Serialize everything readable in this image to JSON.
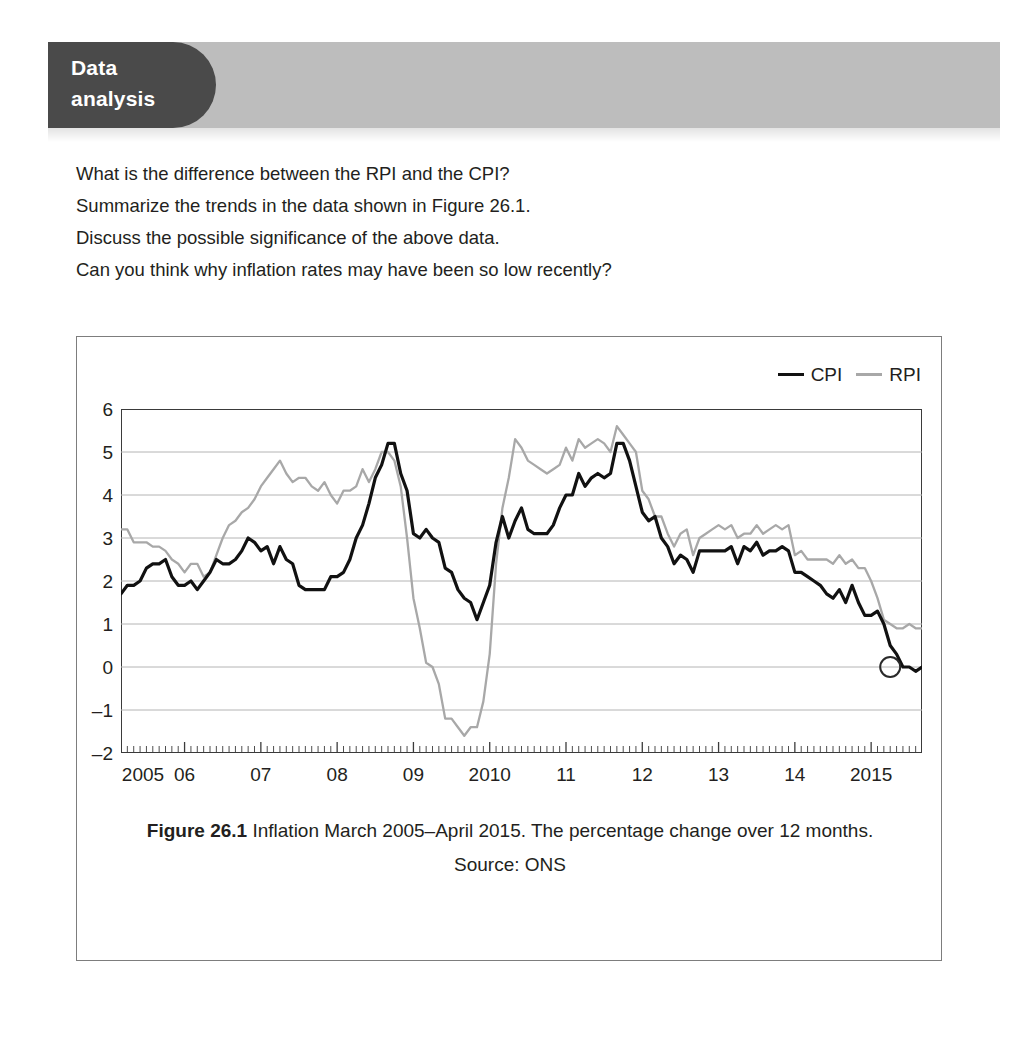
{
  "header": {
    "tab_line1": "Data",
    "tab_line2": "analysis",
    "band_color": "#bdbdbd",
    "tab_color": "#4a4a4a"
  },
  "questions": [
    "What is the difference between the RPI and the CPI?",
    "Summarize the trends in the data shown in Figure 26.1.",
    "Discuss the possible significance of the above data.",
    "Can you think why inflation rates may have been so low recently?"
  ],
  "legend": {
    "items": [
      {
        "label": "CPI",
        "color": "#111111"
      },
      {
        "label": "RPI",
        "color": "#a8a8a8"
      }
    ]
  },
  "caption": {
    "figure_label": "Figure 26.1",
    "text": " Inflation March 2005–April 2015. The percentage change over 12 months.",
    "source": "Source: ONS"
  },
  "axes": {
    "y_ticks": [
      "6",
      "5",
      "4",
      "3",
      "2",
      "1",
      "0",
      "–1",
      "–2"
    ],
    "x_ticks": [
      "2005",
      "06",
      "07",
      "08",
      "09",
      "2010",
      "11",
      "12",
      "13",
      "14",
      "2015"
    ]
  },
  "chart_data": {
    "type": "line",
    "title": "Inflation March 2005–April 2015. The percentage change over 12 months.",
    "source": "Source: ONS",
    "xlabel": "",
    "ylabel": "Percentage change over 12 months (%)",
    "ylim": [
      -2,
      6
    ],
    "ytick_values": [
      6,
      5,
      4,
      3,
      2,
      1,
      0,
      -1,
      -2
    ],
    "xlim": [
      "2005-03",
      "2015-04"
    ],
    "xtick_labels": [
      "2005",
      "06",
      "07",
      "08",
      "09",
      "2010",
      "11",
      "12",
      "13",
      "14",
      "2015"
    ],
    "xtick_positions": [
      "2005-01",
      "2006-01",
      "2007-01",
      "2008-01",
      "2009-01",
      "2010-01",
      "2011-01",
      "2012-01",
      "2013-01",
      "2014-01",
      "2015-01"
    ],
    "minor_ticks": "monthly",
    "grid": "horizontal",
    "legend_position": "top-right",
    "annotation": {
      "marker": "circle",
      "at_x": "2015-04",
      "at_y": 0.0,
      "note": "circled end point of CPI series at 0.0%"
    },
    "x_start": "2005-03",
    "x_step": "1 month",
    "series": [
      {
        "name": "CPI",
        "color": "#111111",
        "values": [
          1.7,
          1.9,
          1.9,
          2.0,
          2.3,
          2.4,
          2.4,
          2.5,
          2.1,
          1.9,
          1.9,
          2.0,
          1.8,
          2.0,
          2.2,
          2.5,
          2.4,
          2.4,
          2.5,
          2.7,
          3.0,
          2.9,
          2.7,
          2.8,
          2.4,
          2.8,
          2.5,
          2.4,
          1.9,
          1.8,
          1.8,
          1.8,
          1.8,
          2.1,
          2.1,
          2.2,
          2.5,
          3.0,
          3.3,
          3.8,
          4.4,
          4.7,
          5.2,
          5.2,
          4.5,
          4.1,
          3.1,
          3.0,
          3.2,
          3.0,
          2.9,
          2.3,
          2.2,
          1.8,
          1.6,
          1.5,
          1.1,
          1.5,
          1.9,
          2.9,
          3.5,
          3.0,
          3.4,
          3.7,
          3.2,
          3.1,
          3.1,
          3.1,
          3.3,
          3.7,
          4.0,
          4.0,
          4.5,
          4.2,
          4.4,
          4.5,
          4.4,
          4.5,
          5.2,
          5.2,
          4.8,
          4.2,
          3.6,
          3.4,
          3.5,
          3.0,
          2.8,
          2.4,
          2.6,
          2.5,
          2.2,
          2.7,
          2.7,
          2.7,
          2.7,
          2.7,
          2.8,
          2.4,
          2.8,
          2.7,
          2.9,
          2.6,
          2.7,
          2.7,
          2.8,
          2.7,
          2.2,
          2.2,
          2.1,
          2.0,
          1.9,
          1.7,
          1.6,
          1.8,
          1.5,
          1.9,
          1.5,
          1.2,
          1.2,
          1.3,
          1.0,
          0.5,
          0.3,
          0.0,
          0.0,
          -0.1,
          0.0
        ]
      },
      {
        "name": "RPI",
        "color": "#a8a8a8",
        "values": [
          3.2,
          3.2,
          2.9,
          2.9,
          2.9,
          2.8,
          2.8,
          2.7,
          2.5,
          2.4,
          2.2,
          2.4,
          2.4,
          2.1,
          2.2,
          2.6,
          3.0,
          3.3,
          3.4,
          3.6,
          3.7,
          3.9,
          4.2,
          4.4,
          4.6,
          4.8,
          4.5,
          4.3,
          4.4,
          4.4,
          4.2,
          4.1,
          4.3,
          4.0,
          3.8,
          4.1,
          4.1,
          4.2,
          4.6,
          4.3,
          4.6,
          5.0,
          5.0,
          4.8,
          4.2,
          3.0,
          1.6,
          0.9,
          0.1,
          0.0,
          -0.4,
          -1.2,
          -1.2,
          -1.4,
          -1.6,
          -1.4,
          -1.4,
          -0.8,
          0.3,
          2.4,
          3.7,
          4.4,
          5.3,
          5.1,
          4.8,
          4.7,
          4.6,
          4.5,
          4.6,
          4.7,
          5.1,
          4.8,
          5.3,
          5.1,
          5.2,
          5.3,
          5.2,
          5.0,
          5.6,
          5.4,
          5.2,
          5.0,
          4.1,
          3.9,
          3.5,
          3.5,
          3.1,
          2.8,
          3.1,
          3.2,
          2.6,
          3.0,
          3.1,
          3.2,
          3.3,
          3.2,
          3.3,
          3.0,
          3.1,
          3.1,
          3.3,
          3.1,
          3.2,
          3.3,
          3.2,
          3.3,
          2.6,
          2.7,
          2.5,
          2.5,
          2.5,
          2.5,
          2.4,
          2.6,
          2.4,
          2.5,
          2.3,
          2.3,
          2.0,
          1.6,
          1.1,
          1.0,
          0.9,
          0.9,
          1.0,
          0.9,
          0.9
        ]
      }
    ]
  }
}
